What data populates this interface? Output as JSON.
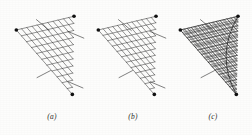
{
  "figure": {
    "name": "ruled-surface-string-construction",
    "background_color": "#fdfdfc",
    "ink_color": "#1e1e1e",
    "node_color": "#111111",
    "width": 252,
    "height": 135,
    "panel_count": 3
  },
  "panels": [
    {
      "id": "a",
      "caption": "(a)",
      "caption_x": 52,
      "caption_y": 112,
      "origin_x": 4,
      "origin_y": 0,
      "vertices": {
        "left": {
          "x": 44,
          "y": 65,
          "label": "left-vertex"
        },
        "top_right": {
          "x": 250,
          "y": 16,
          "label": "top-right-vertex"
        },
        "bottom_right": {
          "x": 244,
          "y": 295,
          "label": "bottom-right-vertex"
        }
      },
      "grid": {
        "divisions": 11,
        "family_a_label": "lines-from-left-to-right-edge",
        "family_b_label": "lines-from-top-to-bottom-edge"
      },
      "overhangs": [
        {
          "label": "top-left-overhang",
          "x1": 116,
          "y1": 28,
          "x2": 162,
          "y2": 67
        },
        {
          "label": "right-upper-overhang",
          "x1": 228,
          "y1": 70,
          "x2": 285,
          "y2": 94
        },
        {
          "label": "bottom-left-overhang",
          "x1": 118,
          "y1": 235,
          "x2": 166,
          "y2": 210
        },
        {
          "label": "bottom-right-overhang",
          "x1": 230,
          "y1": 250,
          "x2": 282,
          "y2": 272
        }
      ],
      "envelope": false,
      "description": "Open triangular net of two straight-line families, no shaded envelope"
    },
    {
      "id": "b",
      "caption": "(b)",
      "caption_x": 133,
      "caption_y": 112,
      "origin_x": 86,
      "origin_y": 0,
      "vertices": {
        "left": {
          "x": 44,
          "y": 65,
          "label": "left-vertex"
        },
        "top_right": {
          "x": 250,
          "y": 16,
          "label": "top-right-vertex"
        },
        "bottom_right": {
          "x": 244,
          "y": 295,
          "label": "bottom-right-vertex"
        }
      },
      "grid": {
        "divisions": 12,
        "family_a_label": "lines-from-left-to-right-edge",
        "family_b_label": "lines-from-top-to-bottom-edge"
      },
      "overhangs": [
        {
          "label": "top-left-overhang",
          "x1": 116,
          "y1": 28,
          "x2": 162,
          "y2": 67
        },
        {
          "label": "right-upper-overhang",
          "x1": 228,
          "y1": 70,
          "x2": 285,
          "y2": 94
        },
        {
          "label": "bottom-left-overhang",
          "x1": 118,
          "y1": 235,
          "x2": 166,
          "y2": 210
        },
        {
          "label": "bottom-right-overhang",
          "x1": 230,
          "y1": 250,
          "x2": 282,
          "y2": 272
        }
      ],
      "envelope": false,
      "description": "Denser triangular net, same construction as panel a"
    },
    {
      "id": "c",
      "caption": "(c)",
      "caption_x": 213,
      "caption_y": 112,
      "origin_x": 168,
      "origin_y": 0,
      "vertices": {
        "left": {
          "x": 44,
          "y": 65,
          "label": "left-vertex"
        },
        "top_right": {
          "x": 250,
          "y": 16,
          "label": "top-right-vertex"
        },
        "bottom_right": {
          "x": 244,
          "y": 295,
          "label": "bottom-right-vertex"
        }
      },
      "grid": {
        "divisions": 16,
        "family_a_label": "lines-from-left-to-right-edge",
        "family_b_label": "lines-from-top-to-bottom-edge"
      },
      "overhangs": [
        {
          "label": "top-left-overhang",
          "x1": 116,
          "y1": 28,
          "x2": 162,
          "y2": 67
        },
        {
          "label": "bottom-left-overhang",
          "x1": 118,
          "y1": 235,
          "x2": 166,
          "y2": 210
        }
      ],
      "envelope": true,
      "envelope_label": "parabolic-envelope-curve",
      "description": "Dense net whose straight lines reveal a shaded parabolic envelope along the right side"
    }
  ]
}
